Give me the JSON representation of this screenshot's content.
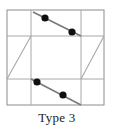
{
  "figure": {
    "caption": "Type 3",
    "colors": {
      "grid_line": "#a8a8a8",
      "outer_border": "#8c8c8c",
      "segment_line": "#7a7a7a",
      "dot_fill": "#101010",
      "background": "#ffffff",
      "caption_text": "#1b1b1b"
    },
    "square": {
      "x": 7,
      "y": 10,
      "width": 97,
      "height": 95
    },
    "grid": {
      "horizontal_y": [
        36,
        79
      ],
      "vertical_x": [
        31,
        81
      ]
    },
    "diagonals": [
      {
        "name": "left-parallelogram-diagonal",
        "x1": 7,
        "y1": 79,
        "x2": 31,
        "y2": 36
      },
      {
        "name": "right-parallelogram-diagonal",
        "x1": 81,
        "y1": 79,
        "x2": 104,
        "y2": 36
      }
    ],
    "segments": [
      {
        "name": "top-segment",
        "x1": 33,
        "y1": 12,
        "x2": 81,
        "y2": 36,
        "dots": [
          {
            "cx": 45,
            "cy": 18,
            "r": 3.6
          },
          {
            "cx": 72,
            "cy": 32,
            "r": 3.6
          }
        ]
      },
      {
        "name": "bottom-segment",
        "x1": 31,
        "y1": 79,
        "x2": 81,
        "y2": 105,
        "dots": [
          {
            "cx": 37,
            "cy": 82,
            "r": 3.6
          },
          {
            "cx": 63,
            "cy": 95,
            "r": 3.6
          }
        ]
      }
    ]
  }
}
